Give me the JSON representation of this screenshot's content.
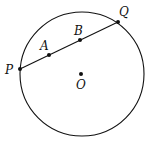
{
  "diagram": {
    "type": "circle-chord",
    "circle": {
      "cx": 82,
      "cy": 74,
      "r": 62,
      "center_label": "O"
    },
    "chord": {
      "from": "P",
      "to": "Q"
    },
    "points": [
      {
        "id": "P",
        "label": "P",
        "x": 20,
        "y": 69,
        "lx": 5,
        "ly": 74
      },
      {
        "id": "A",
        "label": "A",
        "x": 49,
        "y": 55,
        "lx": 40,
        "ly": 50
      },
      {
        "id": "B",
        "label": "B",
        "x": 80,
        "y": 40,
        "lx": 74,
        "ly": 35
      },
      {
        "id": "Q",
        "label": "Q",
        "x": 118,
        "y": 22,
        "lx": 119,
        "ly": 16
      },
      {
        "id": "O",
        "label": "O",
        "x": 81,
        "y": 74,
        "lx": 76,
        "ly": 89
      }
    ],
    "stroke_color": "#111111"
  }
}
